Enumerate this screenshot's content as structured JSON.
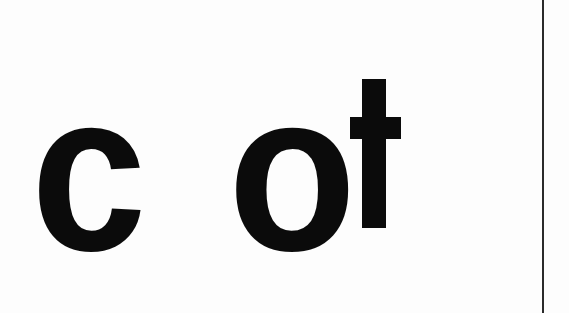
{
  "word_fragment": {
    "full_text": "c ot",
    "glyphs": [
      {
        "char": "c"
      },
      {
        "char": "o"
      },
      {
        "char": "t"
      }
    ]
  },
  "colors": {
    "ink": "#0b0b0b",
    "background": "#fdfdfd",
    "rule": "#2a2a2a"
  }
}
